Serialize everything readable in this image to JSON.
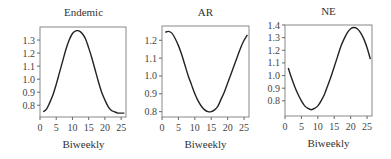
{
  "chart_data": [
    {
      "type": "line",
      "title": "Endemic",
      "xlabel": "Biweekly",
      "ylabel": "",
      "xlim": [
        0,
        26.5
      ],
      "ylim": [
        0.71,
        1.4
      ],
      "xticks": [
        0,
        5,
        10,
        15,
        20,
        25
      ],
      "yticks": [
        0.8,
        0.9,
        1.0,
        1.1,
        1.2,
        1.3
      ],
      "ytick_labels": [
        "0.8",
        "0.9",
        "1.0",
        "1.1",
        "1.2",
        "1.3"
      ],
      "grid": false,
      "series": [
        {
          "name": "Endemic",
          "x": [
            1,
            2,
            3,
            4,
            5,
            6,
            7,
            8,
            9,
            10,
            11,
            12,
            13,
            14,
            15,
            16,
            17,
            18,
            19,
            20,
            21,
            22,
            23,
            24,
            25,
            26
          ],
          "values": [
            0.75,
            0.77,
            0.82,
            0.88,
            0.96,
            1.05,
            1.14,
            1.23,
            1.3,
            1.35,
            1.37,
            1.37,
            1.35,
            1.31,
            1.24,
            1.16,
            1.07,
            0.98,
            0.9,
            0.84,
            0.79,
            0.76,
            0.75,
            0.74,
            0.74,
            0.74
          ]
        }
      ]
    },
    {
      "type": "line",
      "title": "AR",
      "xlabel": "Biweekly",
      "ylabel": "",
      "xlim": [
        0,
        26.5
      ],
      "ylim": [
        0.77,
        1.28
      ],
      "xticks": [
        0,
        5,
        10,
        15,
        20,
        25
      ],
      "yticks": [
        0.8,
        0.9,
        1.0,
        1.1,
        1.2
      ],
      "ytick_labels": [
        "0.8",
        "0.9",
        "1.0",
        "1.1",
        "1.2"
      ],
      "grid": false,
      "series": [
        {
          "name": "AR",
          "x": [
            1,
            2,
            3,
            4,
            5,
            6,
            7,
            8,
            9,
            10,
            11,
            12,
            13,
            14,
            15,
            16,
            17,
            18,
            19,
            20,
            21,
            22,
            23,
            24,
            25,
            26
          ],
          "values": [
            1.245,
            1.25,
            1.24,
            1.21,
            1.17,
            1.12,
            1.06,
            1.0,
            0.95,
            0.9,
            0.86,
            0.83,
            0.81,
            0.8,
            0.8,
            0.81,
            0.83,
            0.87,
            0.91,
            0.96,
            1.01,
            1.06,
            1.11,
            1.16,
            1.2,
            1.23
          ]
        }
      ]
    },
    {
      "type": "line",
      "title": "NE",
      "xlabel": "Biweekly",
      "ylabel": "",
      "xlim": [
        0,
        26.5
      ],
      "ylim": [
        0.68,
        1.4
      ],
      "xticks": [
        0,
        5,
        10,
        15,
        20,
        25
      ],
      "yticks": [
        0.8,
        0.9,
        1.0,
        1.1,
        1.2,
        1.3,
        1.4
      ],
      "ytick_labels": [
        "0.8",
        "0.9",
        "1.0",
        "1.1",
        "1.2",
        "1.3",
        "1.4"
      ],
      "grid": false,
      "series": [
        {
          "name": "NE",
          "x": [
            1,
            2,
            3,
            4,
            5,
            6,
            7,
            8,
            9,
            10,
            11,
            12,
            13,
            14,
            15,
            16,
            17,
            18,
            19,
            20,
            21,
            22,
            23,
            24,
            25,
            26
          ],
          "values": [
            1.06,
            0.98,
            0.91,
            0.85,
            0.8,
            0.76,
            0.74,
            0.73,
            0.74,
            0.76,
            0.8,
            0.85,
            0.92,
            0.99,
            1.07,
            1.15,
            1.23,
            1.29,
            1.34,
            1.37,
            1.38,
            1.37,
            1.34,
            1.29,
            1.22,
            1.13
          ]
        }
      ]
    }
  ]
}
